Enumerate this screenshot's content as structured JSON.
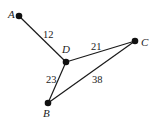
{
  "graph": {
    "nodes": [
      {
        "id": "A",
        "label": "A",
        "x": 19,
        "y": 16,
        "lx": 8,
        "ly": 18
      },
      {
        "id": "D",
        "label": "D",
        "x": 66,
        "y": 62,
        "lx": 62,
        "ly": 53
      },
      {
        "id": "C",
        "label": "C",
        "x": 135,
        "y": 41,
        "lx": 141,
        "ly": 46
      },
      {
        "id": "B",
        "label": "B",
        "x": 48,
        "y": 103,
        "lx": 43,
        "ly": 117
      }
    ],
    "edges": [
      {
        "from": "A",
        "to": "D",
        "weight": "12",
        "lx": 43,
        "ly": 38
      },
      {
        "from": "D",
        "to": "C",
        "weight": "21",
        "lx": 91,
        "ly": 50
      },
      {
        "from": "D",
        "to": "B",
        "weight": "23",
        "lx": 46,
        "ly": 83
      },
      {
        "from": "B",
        "to": "C",
        "weight": "38",
        "lx": 92,
        "ly": 83
      }
    ]
  }
}
